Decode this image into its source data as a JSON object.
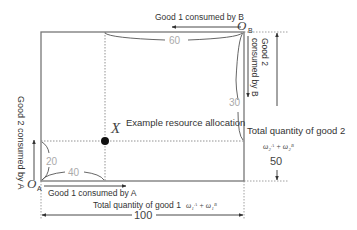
{
  "diagram": {
    "type": "edgeworth-box",
    "origins": {
      "a": {
        "label": "O",
        "subscript": "A"
      },
      "b": {
        "label": "O",
        "subscript": "B"
      }
    },
    "point": {
      "label": "X",
      "caption": "Example resource allocation"
    },
    "braces": {
      "top": "60",
      "right": "30",
      "left": "20",
      "bottom": "40"
    },
    "axes": {
      "good1_by_b": "Good 1 consumed by B",
      "good2_by_b_line1": "Good 2",
      "good2_by_b_line2": "consumed by B",
      "good2_by_a": "Good 2 consumed by A",
      "good1_by_a": "Good 1 consumed by A"
    },
    "totals": {
      "good2_label": "Total quantity of good 2",
      "good2_formula": "ω₂ᴬ + ω₂ᴮ",
      "good2_value": "50",
      "good1_label": "Total quantity of good 1",
      "good1_formula": "ω₁ᴬ + ω₁ᴮ",
      "good1_value": "100"
    }
  }
}
